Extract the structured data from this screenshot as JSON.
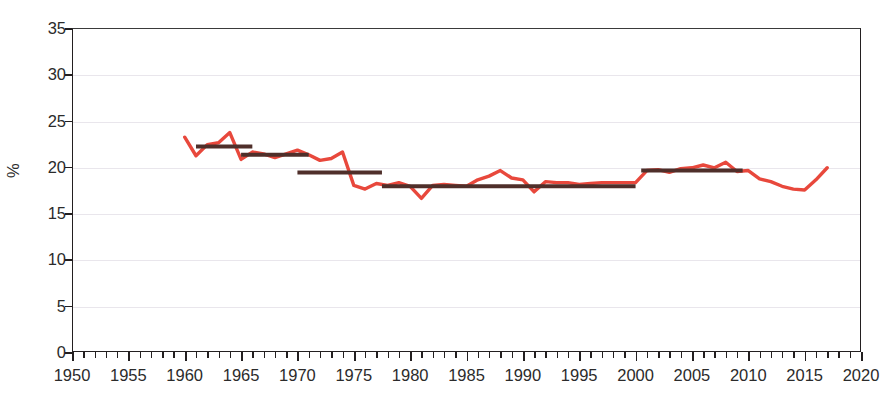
{
  "title_fragment": "",
  "axes": {
    "y_label": "%",
    "y_ticks": [
      "0",
      "5",
      "10",
      "15",
      "20",
      "25",
      "30",
      "35"
    ],
    "x_ticks": [
      "1950",
      "1955",
      "1960",
      "1965",
      "1970",
      "1975",
      "1980",
      "1985",
      "1990",
      "1995",
      "2000",
      "2005",
      "2010",
      "2015",
      "2020"
    ]
  },
  "colors": {
    "series_line": "#e8483c",
    "trend_line": "#4f2f2a",
    "grid": "#e9e6ec",
    "axis": "#231f20",
    "text": "#2b2b2b"
  },
  "chart_data": {
    "type": "line",
    "title": "",
    "xlabel": "",
    "ylabel": "%",
    "xlim": [
      1950,
      2020
    ],
    "ylim": [
      0,
      35
    ],
    "y_ticks": [
      0,
      5,
      10,
      15,
      20,
      25,
      30,
      35
    ],
    "x_ticks": [
      1950,
      1955,
      1960,
      1965,
      1970,
      1975,
      1980,
      1985,
      1990,
      1995,
      2000,
      2005,
      2010,
      2015,
      2020
    ],
    "grid": "horizontal",
    "legend": "none",
    "minor_x_tick_interval": 1,
    "series": [
      {
        "name": "annual series",
        "type": "line",
        "color": "#e8483c",
        "x": [
          1960,
          1961,
          1962,
          1963,
          1964,
          1965,
          1966,
          1967,
          1968,
          1969,
          1970,
          1971,
          1972,
          1973,
          1974,
          1975,
          1976,
          1977,
          1978,
          1979,
          1980,
          1981,
          1982,
          1983,
          1984,
          1985,
          1986,
          1987,
          1988,
          1989,
          1990,
          1991,
          1992,
          1993,
          1994,
          1995,
          1996,
          1997,
          1998,
          1999,
          2000,
          2001,
          2002,
          2003,
          2004,
          2005,
          2006,
          2007,
          2008,
          2009,
          2010,
          2011,
          2012,
          2013,
          2014,
          2015,
          2016,
          2017
        ],
        "values": [
          23.2,
          21.2,
          22.4,
          22.6,
          23.7,
          20.8,
          21.6,
          21.4,
          21.0,
          21.4,
          21.8,
          21.3,
          20.7,
          20.9,
          21.6,
          18.0,
          17.6,
          18.2,
          18.0,
          18.3,
          17.9,
          16.6,
          18.0,
          18.1,
          18.0,
          17.9,
          18.6,
          19.0,
          19.6,
          18.8,
          18.6,
          17.3,
          18.4,
          18.3,
          18.3,
          18.1,
          18.2,
          18.3,
          18.3,
          18.3,
          18.3,
          19.6,
          19.7,
          19.4,
          19.8,
          19.9,
          20.2,
          19.9,
          20.5,
          19.5,
          19.6,
          18.7,
          18.4,
          17.9,
          17.6,
          17.5,
          18.6,
          19.9
        ]
      },
      {
        "name": "period mean segments",
        "type": "step-segments",
        "color": "#4f2f2a",
        "segments": [
          {
            "x_start": 1961,
            "x_end": 1966,
            "value": 22.2
          },
          {
            "x_start": 1965,
            "x_end": 1971,
            "value": 21.3
          },
          {
            "x_start": 1970,
            "x_end": 1977.5,
            "value": 19.4
          },
          {
            "x_start": 1977.5,
            "x_end": 2000,
            "value": 17.9
          },
          {
            "x_start": 2000.5,
            "x_end": 2009.5,
            "value": 19.6
          }
        ]
      }
    ]
  }
}
